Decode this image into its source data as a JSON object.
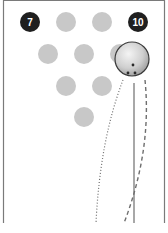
{
  "diagram": {
    "colors": {
      "background": "#ffffff",
      "lane_border": "#7a7a7a",
      "standing_pin": "#1f1f1f",
      "knocked_pin": "#c8c8c8",
      "pin_label": "#ffffff",
      "ball_fill": "#d4d4d4",
      "ball_stroke": "#3a3a3a",
      "path_line": "#6e6e6e"
    },
    "pins": [
      {
        "number": "7",
        "label": "7",
        "cx": 30,
        "cy": 22,
        "standing": true
      },
      {
        "number": "8",
        "label": "",
        "cx": 66,
        "cy": 22,
        "standing": false
      },
      {
        "number": "9",
        "label": "",
        "cx": 102,
        "cy": 22,
        "standing": false
      },
      {
        "number": "10",
        "label": "10",
        "cx": 138,
        "cy": 22,
        "standing": true
      },
      {
        "number": "4",
        "label": "",
        "cx": 48,
        "cy": 54,
        "standing": false
      },
      {
        "number": "5",
        "label": "",
        "cx": 84,
        "cy": 54,
        "standing": false
      },
      {
        "number": "6",
        "label": "",
        "cx": 120,
        "cy": 54,
        "standing": false
      },
      {
        "number": "2",
        "label": "",
        "cx": 66,
        "cy": 86,
        "standing": false
      },
      {
        "number": "3",
        "label": "",
        "cx": 102,
        "cy": 86,
        "standing": false
      },
      {
        "number": "1",
        "label": "",
        "cx": 84,
        "cy": 117,
        "standing": false
      }
    ],
    "ball": {
      "cx": 132,
      "cy": 59,
      "r": 17
    },
    "paths": [
      {
        "name": "dotted-path",
        "style": "dotted"
      },
      {
        "name": "dashed-path",
        "style": "dashed"
      },
      {
        "name": "straight-path",
        "style": "solid"
      }
    ]
  }
}
